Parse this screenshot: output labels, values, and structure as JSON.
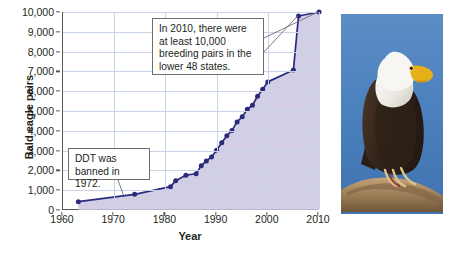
{
  "chart_data": {
    "type": "line",
    "title": "",
    "xlabel": "Year",
    "ylabel": "Bald eagle pairs",
    "xlim": [
      1960,
      2010
    ],
    "ylim": [
      0,
      10000
    ],
    "grid": true,
    "legend": "none",
    "x_ticks": [
      1960,
      1970,
      1980,
      1990,
      2000,
      2010
    ],
    "x_tick_labels": [
      "1960",
      "1970",
      "1980",
      "1990",
      "2000",
      "2010"
    ],
    "y_ticks": [
      0,
      1000,
      2000,
      3000,
      4000,
      5000,
      6000,
      7000,
      8000,
      9000,
      10000
    ],
    "y_tick_labels": [
      "0",
      "1,000",
      "2,000",
      "3,000",
      "4,000",
      "5,000",
      "6,000",
      "7,000",
      "8,000",
      "9,000",
      "10,000"
    ],
    "series": [
      {
        "name": "Bald eagle breeding pairs",
        "color": "#2b2b7c",
        "fill_color": "#c9c6e2",
        "marker": "circle",
        "points": [
          {
            "x": 1963,
            "y": 420
          },
          {
            "x": 1974,
            "y": 790
          },
          {
            "x": 1981,
            "y": 1180
          },
          {
            "x": 1982,
            "y": 1480
          },
          {
            "x": 1984,
            "y": 1760
          },
          {
            "x": 1986,
            "y": 1830
          },
          {
            "x": 1987,
            "y": 2240
          },
          {
            "x": 1988,
            "y": 2480
          },
          {
            "x": 1989,
            "y": 2680
          },
          {
            "x": 1990,
            "y": 3020
          },
          {
            "x": 1991,
            "y": 3400
          },
          {
            "x": 1992,
            "y": 3750
          },
          {
            "x": 1993,
            "y": 4020
          },
          {
            "x": 1994,
            "y": 4450
          },
          {
            "x": 1995,
            "y": 4710
          },
          {
            "x": 1996,
            "y": 5090
          },
          {
            "x": 1997,
            "y": 5290
          },
          {
            "x": 1998,
            "y": 5750
          },
          {
            "x": 1999,
            "y": 6100
          },
          {
            "x": 2000,
            "y": 6470
          },
          {
            "x": 2005,
            "y": 7070
          },
          {
            "x": 2006,
            "y": 9800
          },
          {
            "x": 2010,
            "y": 10000
          }
        ]
      }
    ],
    "annotations": [
      {
        "name": "callout-2010",
        "text": "In 2010, there were at least 10,000 breeding pairs in the lower 48 states.",
        "points_to": [
          2010,
          10000
        ]
      },
      {
        "name": "callout-ddt",
        "text": "DDT was banned in 1972.",
        "points_to": [
          1972,
          760
        ]
      }
    ]
  },
  "axes": {
    "y_title": "Bald eagle pairs",
    "x_title": "Year"
  },
  "photo": {
    "alt_name": "bald-eagle-perched-photo",
    "sky_color": "#4f82bd",
    "head_color": "#f2f2f0",
    "body_color": "#3a2a1e",
    "beak_color": "#e8b018",
    "branch_color": "#a98b63"
  }
}
